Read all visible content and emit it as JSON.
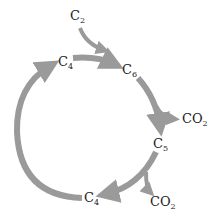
{
  "diagram": {
    "title": "",
    "arrow_color": "#9a9a9a",
    "text_color": "#222222",
    "nodes": [
      {
        "id": "c2",
        "base": "C",
        "sub": "2"
      },
      {
        "id": "c4_top",
        "base": "C",
        "sub": "4"
      },
      {
        "id": "c6",
        "base": "C",
        "sub": "6"
      },
      {
        "id": "co2_a",
        "base": "CO",
        "sub": "2"
      },
      {
        "id": "c5",
        "base": "C",
        "sub": "5"
      },
      {
        "id": "co2_b",
        "base": "CO",
        "sub": "2"
      },
      {
        "id": "c4_bottom",
        "base": "C",
        "sub": "4"
      }
    ],
    "edges": [
      {
        "from": "C2",
        "to": "C6"
      },
      {
        "from": "C4",
        "to": "C6"
      },
      {
        "from": "C6",
        "to": "C5"
      },
      {
        "from": "C6",
        "to": "CO2"
      },
      {
        "from": "C5",
        "to": "C4"
      },
      {
        "from": "C5",
        "to": "CO2"
      },
      {
        "from": "C4",
        "to": "C4",
        "note": "cycle closes via left arc"
      }
    ]
  }
}
